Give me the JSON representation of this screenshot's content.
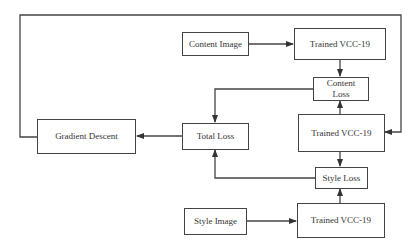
{
  "diagram": {
    "nodes": {
      "content_image": {
        "label": "Content Image"
      },
      "vgg_content": {
        "label": "Trained VCC-19"
      },
      "content_loss": {
        "label": "Content\nLoss"
      },
      "vgg_generated": {
        "label": "Trained VCC-19"
      },
      "total_loss": {
        "label": "Total Loss"
      },
      "gradient_descent": {
        "label": "Gradient Descent"
      },
      "style_loss": {
        "label": "Style Loss"
      },
      "style_image": {
        "label": "Style Image"
      },
      "vgg_style": {
        "label": "Trained VCC-19"
      }
    },
    "edges": [
      {
        "from": "Content Image",
        "to": "Trained VCC-19 (top)"
      },
      {
        "from": "Trained VCC-19 (top)",
        "to": "Content Loss"
      },
      {
        "from": "Trained VCC-19 (middle)",
        "to": "Content Loss"
      },
      {
        "from": "Content Loss",
        "to": "Total Loss"
      },
      {
        "from": "Trained VCC-19 (middle)",
        "to": "Style Loss"
      },
      {
        "from": "Trained VCC-19 (bottom)",
        "to": "Style Loss"
      },
      {
        "from": "Style Image",
        "to": "Trained VCC-19 (bottom)"
      },
      {
        "from": "Style Loss",
        "to": "Total Loss"
      },
      {
        "from": "Total Loss",
        "to": "Gradient Descent"
      },
      {
        "from": "Gradient Descent",
        "to": "Trained VCC-19 (middle)",
        "via": "top feedback loop"
      }
    ],
    "colors": {
      "line": "#444444",
      "background": "#ffffff",
      "text": "#333333"
    }
  }
}
